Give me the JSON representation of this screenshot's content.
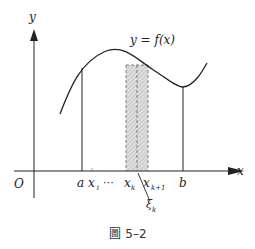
{
  "figure": {
    "caption": "圖 5–2",
    "curve_label": "y = f(x)",
    "axes": {
      "x_label": "x",
      "y_label": "y",
      "origin_label": "O"
    },
    "x_ticks": [
      "a",
      "x",
      "⋯",
      "x",
      "x",
      "b"
    ],
    "tick_labels": {
      "a": "a",
      "x1_base": "x",
      "x1_sub": "1",
      "dots": "⋯",
      "xk_base": "x",
      "xk_sub": "k",
      "xk1_base": "x",
      "xk1_sub": "k+1",
      "b": "b"
    },
    "sample_point": {
      "base": "ξ",
      "sub": "k"
    },
    "colors": {
      "stroke": "#222222",
      "shade": "#d9d9d9",
      "hatch": "#9a9a9a",
      "background": "#ffffff"
    }
  }
}
